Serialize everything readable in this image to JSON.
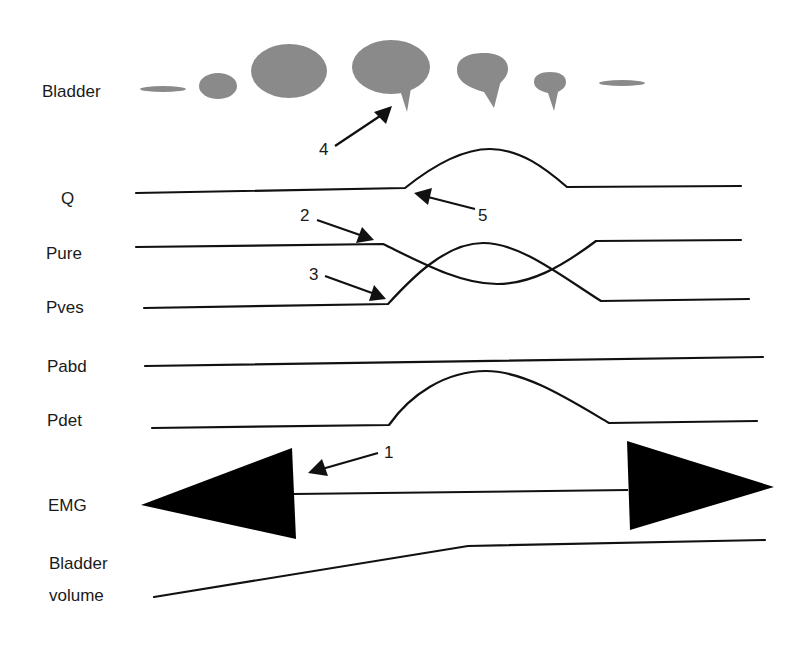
{
  "diagram": {
    "colors": {
      "bladder_fill": "#8a8a8a",
      "trace": "#111111",
      "emg": "#000000",
      "background": "#ffffff"
    },
    "row_labels": {
      "bladder": "Bladder",
      "q": "Q",
      "pure": "Pure",
      "pves": "Pves",
      "pabd": "Pabd",
      "pdet": "Pdet",
      "emg": "EMG",
      "bladder_volume_line1": "Bladder",
      "bladder_volume_line2": "volume"
    },
    "annotations": [
      {
        "id": "1",
        "label": "1",
        "target": "EMG activity cessation (left burst end)"
      },
      {
        "id": "2",
        "label": "2",
        "target": "Pure begins to fall"
      },
      {
        "id": "3",
        "label": "3",
        "target": "Pves begins to rise"
      },
      {
        "id": "4",
        "label": "4",
        "target": "Bladder neck funnelling"
      },
      {
        "id": "5",
        "label": "5",
        "target": "Onset of flow Q"
      }
    ],
    "bladder_shapes": [
      {
        "stage": 1,
        "shape": "flat-empty"
      },
      {
        "stage": 2,
        "shape": "small"
      },
      {
        "stage": 3,
        "shape": "full"
      },
      {
        "stage": 4,
        "shape": "full-funnelled"
      },
      {
        "stage": 5,
        "shape": "emptying"
      },
      {
        "stage": 6,
        "shape": "nearly-empty"
      },
      {
        "stage": 7,
        "shape": "flat-empty"
      }
    ]
  }
}
